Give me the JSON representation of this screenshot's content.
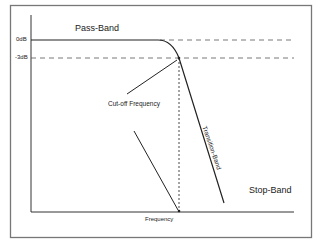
{
  "diagram": {
    "regions": {
      "pass_band": "Pass-Band",
      "transition_band": "Transition-Band",
      "stop_band": "Stop-Band"
    },
    "y_ticks": {
      "zero_db": "0dB",
      "minus_3db": "-3dB"
    },
    "annotations": {
      "cutoff": "Cut-off Frequency"
    },
    "x_axis_label": "Frequency",
    "colors": {
      "line": "#222222",
      "border": "#777777",
      "background": "#ffffff"
    }
  }
}
